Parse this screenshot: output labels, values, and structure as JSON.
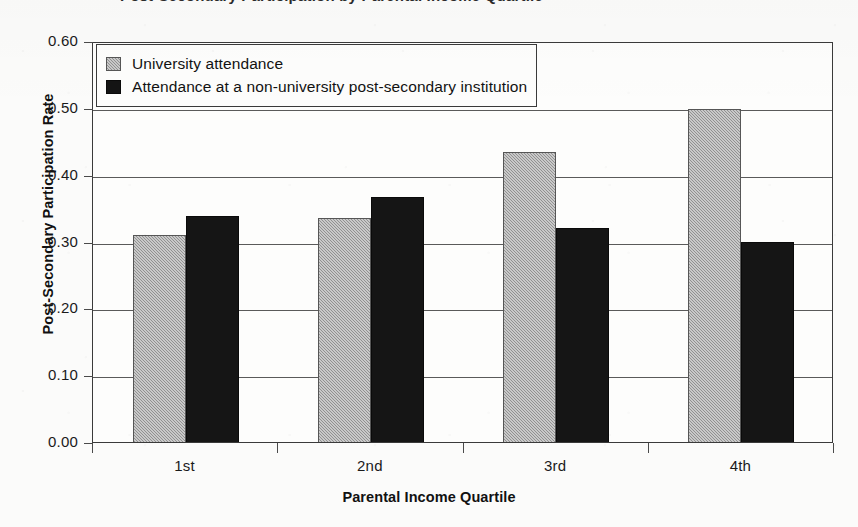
{
  "figure": {
    "title_clipped": "Post-Secondary Participation by Parental Income Quartile"
  },
  "chart_data": {
    "type": "bar",
    "title": "",
    "categories": [
      "1st",
      "2nd",
      "3rd",
      "4th"
    ],
    "series": [
      {
        "name": "University attendance",
        "key": "university",
        "color": "#a3a3a3",
        "values": [
          0.31,
          0.335,
          0.434,
          0.499
        ]
      },
      {
        "name": "Attendance at a non-university post-secondary institution",
        "key": "nonuniversity",
        "color": "#141414",
        "values": [
          0.338,
          0.366,
          0.32,
          0.3
        ]
      }
    ],
    "xlabel": "Parental Income Quartile",
    "ylabel": "Post-Secondary Participation Rate",
    "ylim": [
      0.0,
      0.6
    ],
    "ytick_step": 0.1,
    "ytick_labels": [
      "0.00",
      "0.10",
      "0.20",
      "0.30",
      "0.40",
      "0.50",
      "0.60"
    ],
    "grid": true,
    "legend_position": "top-left"
  },
  "legend": {
    "items": [
      {
        "label": "University attendance",
        "swatch": "university"
      },
      {
        "label": "Attendance at a non-university post-secondary institution",
        "swatch": "nonuniversity"
      }
    ]
  }
}
